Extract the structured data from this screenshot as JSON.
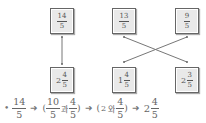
{
  "top_boxes": [
    {
      "numerator": "14",
      "denominator": "5"
    },
    {
      "numerator": "13",
      "denominator": "5"
    },
    {
      "numerator": "9",
      "denominator": "5"
    }
  ],
  "bottom_boxes": [
    {
      "whole": "2",
      "numerator": "4",
      "denominator": "5"
    },
    {
      "whole": "1",
      "numerator": "4",
      "denominator": "5"
    },
    {
      "whole": "2",
      "numerator": "3",
      "denominator": "5"
    }
  ],
  "connections": [
    {
      "from": "top-0",
      "to": "bottom-0"
    },
    {
      "from": "top-1",
      "to": "bottom-2"
    },
    {
      "from": "top-2",
      "to": "bottom-1"
    }
  ],
  "equation": {
    "bullet": "•",
    "arrow": "➜",
    "step1": {
      "numerator": "14",
      "denominator": "5"
    },
    "step2": {
      "open": "(",
      "a_num": "10",
      "a_den": "5",
      "conj": "과",
      "b_num": "4",
      "b_den": "5",
      "close": ")"
    },
    "step3": {
      "open": "(",
      "whole": "2",
      "conj": "와",
      "num": "4",
      "den": "5",
      "close": ")"
    },
    "step4": {
      "whole": "2",
      "num": "4",
      "den": "5"
    }
  },
  "colors": {
    "box_fill": "#e9e9e9",
    "box_border": "#666666",
    "line": "#666666"
  }
}
